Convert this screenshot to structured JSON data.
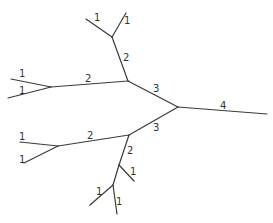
{
  "diagram": {
    "type": "phylogenetic-tree",
    "colors": {
      "line": "#3a3a3a",
      "text": "#333333",
      "background": "#ffffff"
    },
    "nodes": {
      "root": [
        178,
        107
      ],
      "A": [
        128,
        81
      ],
      "B": [
        129,
        135
      ],
      "T": [
        112,
        37
      ],
      "L1": [
        51,
        87
      ],
      "L2": [
        58,
        146
      ],
      "M": [
        119,
        165
      ],
      "N": [
        113,
        185
      ]
    },
    "edges": [
      {
        "id": "root-leaf",
        "from": [
          178,
          107
        ],
        "to": [
          267,
          114
        ],
        "label": "4",
        "lx": 220,
        "ly": 109
      },
      {
        "id": "root-A",
        "from": [
          178,
          107
        ],
        "to": [
          128,
          81
        ],
        "label": "3",
        "lx": 153,
        "ly": 92
      },
      {
        "id": "root-B",
        "from": [
          178,
          107
        ],
        "to": [
          129,
          135
        ],
        "label": "3",
        "lx": 153,
        "ly": 131
      },
      {
        "id": "A-T",
        "from": [
          128,
          81
        ],
        "to": [
          112,
          37
        ],
        "label": "2",
        "lx": 123,
        "ly": 61
      },
      {
        "id": "T-leaf1",
        "from": [
          112,
          37
        ],
        "to": [
          86,
          19
        ],
        "label": "1",
        "lx": 94,
        "ly": 21
      },
      {
        "id": "T-leaf2",
        "from": [
          112,
          37
        ],
        "to": [
          126,
          13
        ],
        "label": "1",
        "lx": 124,
        "ly": 24
      },
      {
        "id": "A-L1",
        "from": [
          128,
          81
        ],
        "to": [
          51,
          87
        ],
        "label": "2",
        "lx": 85,
        "ly": 82
      },
      {
        "id": "L1-leaf1",
        "from": [
          51,
          87
        ],
        "to": [
          11,
          79
        ],
        "label": "1",
        "lx": 19,
        "ly": 77
      },
      {
        "id": "L1-leaf2",
        "from": [
          51,
          87
        ],
        "to": [
          8,
          98
        ],
        "label": "1",
        "lx": 19,
        "ly": 94
      },
      {
        "id": "B-L2",
        "from": [
          129,
          135
        ],
        "to": [
          58,
          146
        ],
        "label": "2",
        "lx": 87,
        "ly": 139
      },
      {
        "id": "L2-leaf1",
        "from": [
          58,
          146
        ],
        "to": [
          20,
          142
        ],
        "label": "1",
        "lx": 19,
        "ly": 140
      },
      {
        "id": "L2-leaf2",
        "from": [
          58,
          146
        ],
        "to": [
          24,
          163
        ],
        "label": "1",
        "lx": 19,
        "ly": 163
      },
      {
        "id": "B-M",
        "from": [
          129,
          135
        ],
        "to": [
          119,
          165
        ],
        "label": "2",
        "lx": 127,
        "ly": 154
      },
      {
        "id": "M-leaf",
        "from": [
          119,
          165
        ],
        "to": [
          134,
          181
        ],
        "label": "1",
        "lx": 130,
        "ly": 175
      },
      {
        "id": "M-N",
        "from": [
          119,
          165
        ],
        "to": [
          113,
          185
        ],
        "label": "",
        "lx": 0,
        "ly": 0
      },
      {
        "id": "N-leaf1",
        "from": [
          113,
          185
        ],
        "to": [
          90,
          205
        ],
        "label": "1",
        "lx": 96,
        "ly": 195
      },
      {
        "id": "N-leaf2",
        "from": [
          113,
          185
        ],
        "to": [
          117,
          214
        ],
        "label": "1",
        "lx": 116,
        "ly": 205
      }
    ]
  }
}
